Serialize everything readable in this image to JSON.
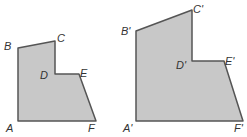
{
  "figures": [
    {
      "name": "original",
      "points": {
        "A": [
          18,
          121
        ],
        "B": [
          18,
          48
        ],
        "C": [
          55,
          41
        ],
        "D": [
          55,
          74
        ],
        "E": [
          79,
          74
        ],
        "F": [
          96,
          121
        ]
      },
      "labels": [
        {
          "text": "B",
          "x": 4,
          "y": 50
        },
        {
          "text": "C",
          "x": 57,
          "y": 42
        },
        {
          "text": "D",
          "x": 40,
          "y": 79
        },
        {
          "text": "E",
          "x": 80,
          "y": 77
        },
        {
          "text": "A",
          "x": 6,
          "y": 132
        },
        {
          "text": "F",
          "x": 88,
          "y": 132
        }
      ]
    },
    {
      "name": "image",
      "points": {
        "A": [
          136,
          121
        ],
        "B": [
          136,
          31
        ],
        "C": [
          192,
          10
        ],
        "D": [
          192,
          61
        ],
        "E": [
          224,
          61
        ],
        "F": [
          243,
          121
        ]
      },
      "labels": [
        {
          "text": "B'",
          "x": 121,
          "y": 35
        },
        {
          "text": "C'",
          "x": 193,
          "y": 13
        },
        {
          "text": "D'",
          "x": 176,
          "y": 69
        },
        {
          "text": "E'",
          "x": 225,
          "y": 65
        },
        {
          "text": "A'",
          "x": 123,
          "y": 132
        },
        {
          "text": "F'",
          "x": 234,
          "y": 132
        }
      ]
    }
  ],
  "colors": {
    "fill": "#c8c8c8",
    "stroke": "#555555"
  }
}
